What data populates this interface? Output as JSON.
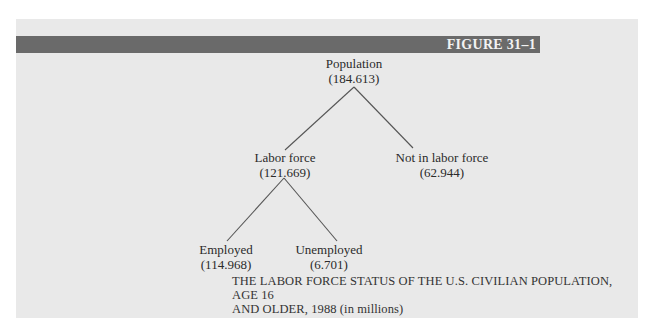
{
  "figure": {
    "label": "FIGURE 31–1",
    "caption_line1": "THE LABOR FORCE STATUS OF THE U.S. CIVILIAN POPULATION, AGE 16",
    "caption_line2": "AND OLDER, 1988 (in millions)"
  },
  "tree": {
    "root": {
      "label": "Population",
      "value": "(184.613)"
    },
    "labor_force": {
      "label": "Labor force",
      "value": "(121.669)"
    },
    "not_in_labor_force": {
      "label": "Not in labor force",
      "value": "(62.944)"
    },
    "employed": {
      "label": "Employed",
      "value": "(114.968)"
    },
    "unemployed": {
      "label": "Unemployed",
      "value": "(6.701)"
    }
  },
  "colors": {
    "panel": "#e9e9e9",
    "bar": "#6a6a6a",
    "line": "#555555"
  }
}
